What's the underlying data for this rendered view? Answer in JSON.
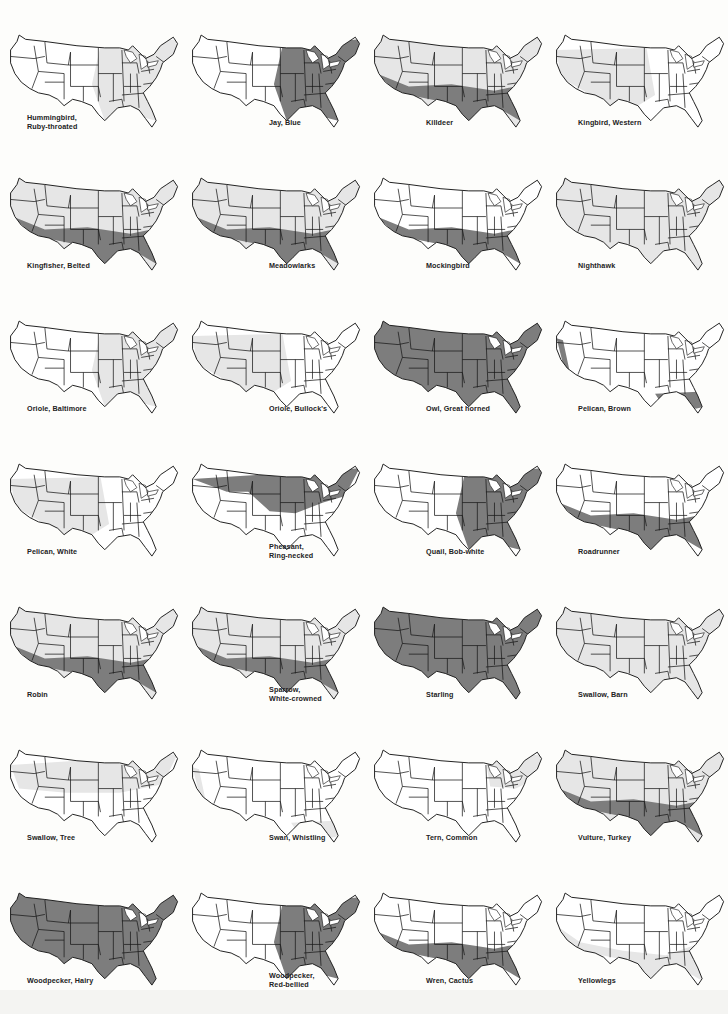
{
  "page": {
    "colors": {
      "background": "#fdfdfb",
      "none": "#ffffff",
      "light": "#e6e6e6",
      "dark": "#7d7d7d",
      "outline": "#1a1a1a"
    }
  },
  "maps": [
    {
      "caption": [
        "Hummingbird,",
        "Ruby-throated"
      ],
      "shade": "light-east"
    },
    {
      "caption": [
        "Jay, Blue"
      ],
      "shade": "dark-east"
    },
    {
      "caption": [
        "Killdeer"
      ],
      "shade": "dark-south-light-north"
    },
    {
      "caption": [
        "Kingbird, Western"
      ],
      "shade": "light-west"
    },
    {
      "caption": [
        "Kingfisher, Belted"
      ],
      "shade": "dark-south-light-north"
    },
    {
      "caption": [
        "Meadowlarks"
      ],
      "shade": "dark-south-light-north"
    },
    {
      "caption": [
        "Mockingbird"
      ],
      "shade": "dark-south"
    },
    {
      "caption": [
        "Nighthawk"
      ],
      "shade": "light-all"
    },
    {
      "caption": [
        "Oriole, Baltimore"
      ],
      "shade": "light-east"
    },
    {
      "caption": [
        "Oriole, Bullock's"
      ],
      "shade": "light-west"
    },
    {
      "caption": [
        "Owl, Great horned"
      ],
      "shade": "dark-all"
    },
    {
      "caption": [
        "Pelican, Brown"
      ],
      "shade": "dark-coast"
    },
    {
      "caption": [
        "Pelican, White"
      ],
      "shade": "light-west"
    },
    {
      "caption": [
        "Pheasant,",
        "Ring-necked"
      ],
      "shade": "dark-north"
    },
    {
      "caption": [
        "Quail, Bob-white"
      ],
      "shade": "dark-east"
    },
    {
      "caption": [
        "Roadrunner"
      ],
      "shade": "dark-southwest"
    },
    {
      "caption": [
        "Robin"
      ],
      "shade": "dark-south-light-north"
    },
    {
      "caption": [
        "Sparrow,",
        "White-crowned"
      ],
      "shade": "dark-south-light-north"
    },
    {
      "caption": [
        "Starling"
      ],
      "shade": "dark-all"
    },
    {
      "caption": [
        "Swallow, Barn"
      ],
      "shade": "light-all"
    },
    {
      "caption": [
        "Swallow, Tree"
      ],
      "shade": "light-north"
    },
    {
      "caption": [
        "Swan, Whistling"
      ],
      "shade": "light-coast"
    },
    {
      "caption": [
        "Tern, Common"
      ],
      "shade": "light-northeast"
    },
    {
      "caption": [
        "Vulture, Turkey"
      ],
      "shade": "dark-south-light-north"
    },
    {
      "caption": [
        "Woodpecker, Hairy"
      ],
      "shade": "dark-all"
    },
    {
      "caption": [
        "Woodpecker,",
        "Red-bellied"
      ],
      "shade": "dark-east"
    },
    {
      "caption": [
        "Wren, Cactus"
      ],
      "shade": "dark-southwest"
    },
    {
      "caption": [
        "Yellowlegs"
      ],
      "shade": "light-south"
    }
  ]
}
